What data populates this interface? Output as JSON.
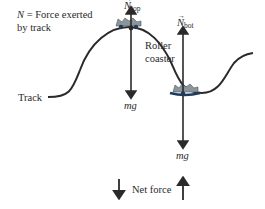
{
  "diagram": {
    "legend": {
      "line1": "= Force exerted",
      "symbol": "N",
      "line2": "by track"
    },
    "labels": {
      "track": "Track",
      "roller_coaster_line1": "Roller",
      "roller_coaster_line2": "coaster",
      "n_top_symbol": "N",
      "n_top_sub": "top",
      "n_bot_symbol": "N",
      "n_bot_sub": "bot",
      "mg_top": "mg",
      "mg_bot": "mg",
      "net_force": "Net force"
    },
    "colors": {
      "ink": "#2a2a2a",
      "car": "#7a8a96",
      "car_dark": "#1f3b5a"
    }
  }
}
